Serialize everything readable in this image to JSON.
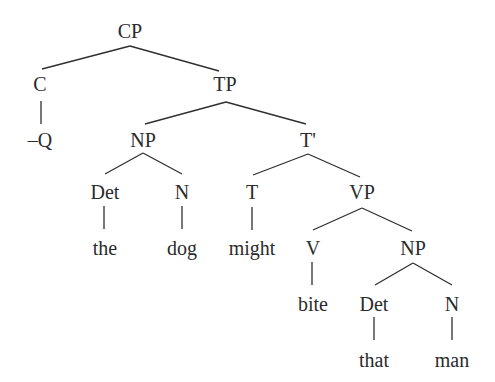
{
  "diagram": {
    "type": "syntax-tree",
    "colors": {
      "text": "#2b2b2b",
      "lines": "#2f2f2f",
      "background": "#ffffff"
    },
    "nodes": {
      "cp": {
        "label": "CP",
        "x": 130,
        "y": 38
      },
      "c": {
        "label": "C",
        "x": 40,
        "y": 91
      },
      "negq": {
        "label": "–Q",
        "x": 40,
        "y": 147
      },
      "tp": {
        "label": "TP",
        "x": 225,
        "y": 91
      },
      "np1": {
        "label": "NP",
        "x": 143,
        "y": 147
      },
      "det1": {
        "label": "Det",
        "x": 105,
        "y": 199
      },
      "the": {
        "label": "the",
        "x": 105,
        "y": 255
      },
      "n1": {
        "label": "N",
        "x": 182,
        "y": 199
      },
      "dog": {
        "label": "dog",
        "x": 182,
        "y": 255
      },
      "tbar": {
        "label": "T'",
        "x": 308,
        "y": 147
      },
      "t": {
        "label": "T",
        "x": 252,
        "y": 199
      },
      "might": {
        "label": "might",
        "x": 252,
        "y": 255
      },
      "vp": {
        "label": "VP",
        "x": 362,
        "y": 199
      },
      "v": {
        "label": "V",
        "x": 313,
        "y": 255
      },
      "bite": {
        "label": "bite",
        "x": 313,
        "y": 311
      },
      "np2": {
        "label": "NP",
        "x": 413,
        "y": 255
      },
      "det2": {
        "label": "Det",
        "x": 374,
        "y": 311
      },
      "that": {
        "label": "that",
        "x": 374,
        "y": 367
      },
      "n2": {
        "label": "N",
        "x": 452,
        "y": 311
      },
      "man": {
        "label": "man",
        "x": 452,
        "y": 367
      }
    },
    "edges": [
      [
        "cp",
        "c"
      ],
      [
        "cp",
        "tp"
      ],
      [
        "c",
        "negq"
      ],
      [
        "tp",
        "np1"
      ],
      [
        "tp",
        "tbar"
      ],
      [
        "np1",
        "det1"
      ],
      [
        "np1",
        "n1"
      ],
      [
        "det1",
        "the"
      ],
      [
        "n1",
        "dog"
      ],
      [
        "tbar",
        "t"
      ],
      [
        "tbar",
        "vp"
      ],
      [
        "t",
        "might"
      ],
      [
        "vp",
        "v"
      ],
      [
        "vp",
        "np2"
      ],
      [
        "v",
        "bite"
      ],
      [
        "np2",
        "det2"
      ],
      [
        "np2",
        "n2"
      ],
      [
        "det2",
        "that"
      ],
      [
        "n2",
        "man"
      ]
    ]
  }
}
